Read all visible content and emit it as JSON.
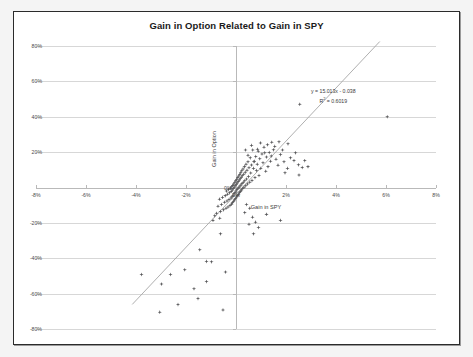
{
  "chart_data": {
    "type": "scatter",
    "title": "Gain in Option Related to Gain in SPY",
    "xlabel": "Gain in SPY",
    "ylabel": "Gain in Option",
    "xlim": [
      -0.08,
      0.08
    ],
    "ylim": [
      -0.8,
      0.8
    ],
    "grid": true,
    "legend": null,
    "x_ticks": [
      "-8%",
      "-6%",
      "-4%",
      "-2%",
      "0%",
      "2%",
      "4%",
      "6%",
      "8%"
    ],
    "x_tick_values": [
      -0.08,
      -0.06,
      -0.04,
      -0.02,
      0.0,
      0.02,
      0.04,
      0.06,
      0.08
    ],
    "y_ticks": [
      "80%",
      "60%",
      "40%",
      "20%",
      "0%",
      "-20%",
      "-40%",
      "-60%",
      "-80%"
    ],
    "y_tick_values": [
      0.8,
      0.6,
      0.4,
      0.2,
      0.0,
      -0.2,
      -0.4,
      -0.6,
      -0.8
    ],
    "annotation": {
      "equation": "y = 15.013x - 0.038",
      "r_squared_label": "R",
      "r_squared_sup": "2",
      "r_squared_value": "= 0.6019",
      "r_squared_full": "R² = 0.6019"
    },
    "trendline": {
      "slope": 15.013,
      "intercept": -0.038,
      "x_start": -0.0415,
      "x_end": 0.0575,
      "color": "#a6a6a6"
    },
    "marker_color": "#59595b",
    "marker_shape": "diamond",
    "points": [
      [
        0.0605,
        0.4
      ],
      [
        0.0255,
        0.47
      ],
      [
        0.0208,
        0.247
      ],
      [
        0.0232,
        0.152
      ],
      [
        0.025,
        0.128
      ],
      [
        0.0265,
        0.113
      ],
      [
        0.0196,
        0.083
      ],
      [
        0.0186,
        0.212
      ],
      [
        0.0172,
        0.258
      ],
      [
        0.016,
        0.16
      ],
      [
        0.015,
        0.213
      ],
      [
        0.0143,
        0.256
      ],
      [
        0.0138,
        0.148
      ],
      [
        0.0133,
        0.198
      ],
      [
        0.0128,
        0.118
      ],
      [
        0.0122,
        0.172
      ],
      [
        0.0119,
        0.092
      ],
      [
        0.0112,
        0.228
      ],
      [
        0.0108,
        0.14
      ],
      [
        0.0104,
        0.19
      ],
      [
        0.0099,
        0.108
      ],
      [
        0.0095,
        0.163
      ],
      [
        0.0092,
        0.068
      ],
      [
        0.0089,
        0.205
      ],
      [
        0.0085,
        0.131
      ],
      [
        0.0082,
        0.096
      ],
      [
        0.0079,
        0.175
      ],
      [
        0.0076,
        0.056
      ],
      [
        0.0073,
        0.148
      ],
      [
        0.007,
        0.108
      ],
      [
        0.0067,
        0.212
      ],
      [
        0.0064,
        0.04
      ],
      [
        0.0062,
        0.127
      ],
      [
        0.0059,
        0.082
      ],
      [
        0.0057,
        0.168
      ],
      [
        0.0055,
        0.03
      ],
      [
        0.0052,
        0.112
      ],
      [
        0.005,
        0.062
      ],
      [
        0.0048,
        0.145
      ],
      [
        0.0046,
        0.02
      ],
      [
        0.0044,
        0.098
      ],
      [
        0.0042,
        0.048
      ],
      [
        0.004,
        0.132
      ],
      [
        0.0039,
        0.01
      ],
      [
        0.0037,
        0.086
      ],
      [
        0.0035,
        0.038
      ],
      [
        0.0034,
        0.118
      ],
      [
        0.0032,
        0.002
      ],
      [
        0.0031,
        0.075
      ],
      [
        0.0029,
        0.03
      ],
      [
        0.0028,
        0.105
      ],
      [
        0.0027,
        -0.006
      ],
      [
        0.0025,
        0.066
      ],
      [
        0.0024,
        0.022
      ],
      [
        0.0023,
        0.094
      ],
      [
        0.0022,
        -0.014
      ],
      [
        0.0021,
        0.058
      ],
      [
        0.002,
        0.014
      ],
      [
        0.0019,
        0.084
      ],
      [
        0.0018,
        -0.022
      ],
      [
        0.0017,
        0.05
      ],
      [
        0.0016,
        0.008
      ],
      [
        0.0015,
        0.074
      ],
      [
        0.0014,
        -0.03
      ],
      [
        0.0013,
        0.042
      ],
      [
        0.0012,
        0.002
      ],
      [
        0.0011,
        0.065
      ],
      [
        0.001,
        -0.038
      ],
      [
        0.0009,
        0.034
      ],
      [
        0.0008,
        -0.004
      ],
      [
        0.0007,
        0.056
      ],
      [
        0.0006,
        -0.046
      ],
      [
        0.0005,
        0.026
      ],
      [
        0.0004,
        -0.012
      ],
      [
        0.0003,
        0.047
      ],
      [
        0.0002,
        -0.054
      ],
      [
        0.0001,
        0.018
      ],
      [
        0.0,
        -0.02
      ],
      [
        -0.0001,
        0.038
      ],
      [
        -0.0002,
        -0.062
      ],
      [
        -0.0003,
        0.01
      ],
      [
        -0.0004,
        -0.028
      ],
      [
        -0.0005,
        0.029
      ],
      [
        -0.0006,
        -0.07
      ],
      [
        -0.0007,
        0.002
      ],
      [
        -0.0008,
        -0.036
      ],
      [
        -0.0009,
        0.02
      ],
      [
        -0.001,
        -0.078
      ],
      [
        -0.0011,
        -0.006
      ],
      [
        -0.0012,
        -0.044
      ],
      [
        -0.0013,
        0.012
      ],
      [
        -0.0014,
        -0.086
      ],
      [
        -0.0015,
        -0.014
      ],
      [
        -0.0016,
        -0.052
      ],
      [
        -0.0017,
        0.004
      ],
      [
        -0.0018,
        -0.094
      ],
      [
        -0.0019,
        -0.022
      ],
      [
        -0.002,
        -0.06
      ],
      [
        -0.0022,
        -0.004
      ],
      [
        -0.0024,
        -0.102
      ],
      [
        -0.0026,
        -0.03
      ],
      [
        -0.0028,
        -0.068
      ],
      [
        -0.003,
        -0.012
      ],
      [
        -0.0032,
        -0.11
      ],
      [
        -0.0034,
        -0.038
      ],
      [
        -0.0036,
        -0.076
      ],
      [
        -0.0038,
        -0.02
      ],
      [
        -0.004,
        -0.118
      ],
      [
        -0.0043,
        -0.046
      ],
      [
        -0.0046,
        -0.084
      ],
      [
        -0.005,
        -0.126
      ],
      [
        -0.0054,
        -0.056
      ],
      [
        -0.0058,
        -0.096
      ],
      [
        -0.0062,
        -0.136
      ],
      [
        -0.0066,
        -0.066
      ],
      [
        -0.0072,
        -0.106
      ],
      [
        -0.0078,
        -0.146
      ],
      [
        -0.0085,
        -0.16
      ],
      [
        -0.0092,
        -0.186
      ],
      [
        -0.0065,
        -0.174
      ],
      [
        0.0038,
        0.212
      ],
      [
        0.0048,
        0.182
      ],
      [
        0.0062,
        0.238
      ],
      [
        0.0072,
        0.146
      ],
      [
        0.0086,
        0.216
      ],
      [
        0.0098,
        0.252
      ],
      [
        0.0115,
        0.196
      ],
      [
        0.0126,
        0.242
      ],
      [
        0.0141,
        0.178
      ],
      [
        0.0155,
        0.232
      ],
      [
        0.0168,
        0.126
      ],
      [
        0.0178,
        0.186
      ],
      [
        0.0192,
        0.146
      ],
      [
        0.0206,
        0.108
      ],
      [
        0.0218,
        0.168
      ],
      [
        0.0238,
        0.196
      ],
      [
        0.0252,
        0.07
      ],
      [
        0.0275,
        0.152
      ],
      [
        0.0288,
        0.118
      ],
      [
        0.0035,
        -0.142
      ],
      [
        0.0042,
        -0.096
      ],
      [
        0.0055,
        -0.118
      ],
      [
        0.0066,
        -0.168
      ],
      [
        0.0078,
        -0.196
      ],
      [
        0.0052,
        -0.208
      ],
      [
        0.009,
        -0.226
      ],
      [
        0.007,
        -0.262
      ],
      [
        0.0122,
        -0.152
      ],
      [
        0.0178,
        -0.186
      ],
      [
        -0.0145,
        -0.352
      ],
      [
        -0.0062,
        -0.262
      ],
      [
        -0.0098,
        -0.42
      ],
      [
        -0.0118,
        -0.418
      ],
      [
        -0.0042,
        -0.478
      ],
      [
        -0.0205,
        -0.465
      ],
      [
        -0.0262,
        -0.492
      ],
      [
        -0.0378,
        -0.492
      ],
      [
        -0.0118,
        -0.532
      ],
      [
        -0.0168,
        -0.572
      ],
      [
        -0.0298,
        -0.546
      ],
      [
        -0.0152,
        -0.628
      ],
      [
        -0.0232,
        -0.662
      ],
      [
        -0.0052,
        -0.692
      ],
      [
        -0.0305,
        -0.705
      ]
    ]
  }
}
